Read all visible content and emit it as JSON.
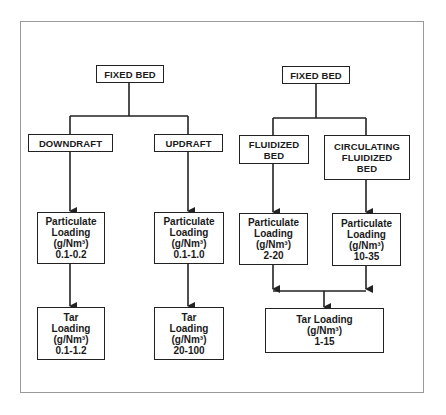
{
  "left_tree": {
    "root": "FIXED BED",
    "branches": [
      {
        "label": "DOWNDRAFT",
        "particulate": {
          "line1": "Particulate",
          "line2": "Loading",
          "unit": "(g/Nm³)",
          "value": "0.1-0.2"
        },
        "tar": {
          "line1": "Tar",
          "line2": "Loading",
          "unit": "(g/Nm³)",
          "value": "0.1-1.2"
        }
      },
      {
        "label": "UPDRAFT",
        "particulate": {
          "line1": "Particulate",
          "line2": "Loading",
          "unit": "(g/Nm³)",
          "value": "0.1-1.0"
        },
        "tar": {
          "line1": "Tar",
          "line2": "Loading",
          "unit": "(g/Nm³)",
          "value": "20-100"
        }
      }
    ]
  },
  "right_tree": {
    "root": "FIXED BED",
    "branches": [
      {
        "label_lines": [
          "FLUIDIZED",
          "BED"
        ],
        "particulate": {
          "line1": "Particulate",
          "line2": "Loading",
          "unit": "(g/Nm³)",
          "value": "2-20"
        }
      },
      {
        "label_lines": [
          "CIRCULATING",
          "FLUIDIZED",
          "BED"
        ],
        "particulate": {
          "line1": "Particulate",
          "line2": "Loading",
          "unit": "(g/Nm³)",
          "value": "10-35"
        }
      }
    ],
    "tar": {
      "line1": "Tar Loading",
      "unit": "(g/Nm³)",
      "value": "1-15"
    }
  },
  "colors": {
    "line": "#222222",
    "frame": "#9a9a9a",
    "background": "#ffffff"
  }
}
